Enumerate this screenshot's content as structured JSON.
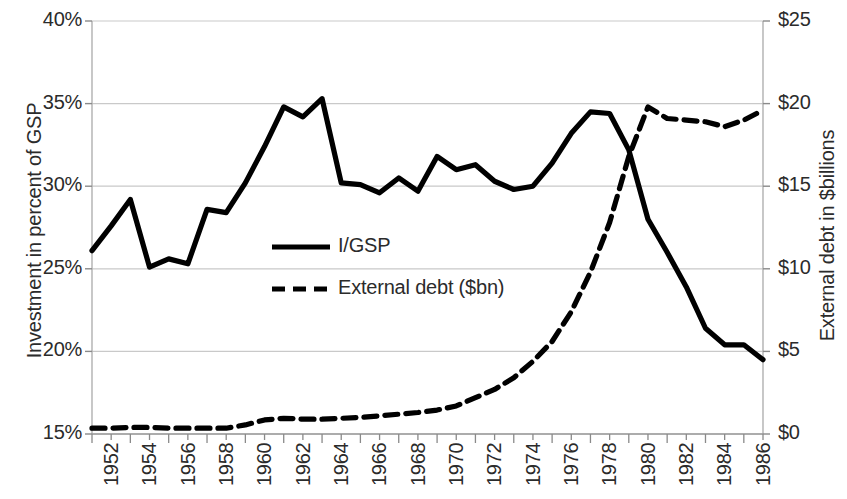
{
  "chart_data": {
    "type": "line",
    "title": "",
    "xlabel": "",
    "ylabel": "Investment in percent of GSP",
    "y2label": "External debt in $billions",
    "grid": true,
    "legend_position": "center-left-inside",
    "ylim": [
      15,
      40
    ],
    "y2lim": [
      0,
      25
    ],
    "ytick_labels": [
      "40%",
      "35%",
      "30%",
      "25%",
      "20%",
      "15%"
    ],
    "ytick_values": [
      40,
      35,
      30,
      25,
      20,
      15
    ],
    "y2tick_labels": [
      "$25",
      "$20",
      "$15",
      "$10",
      "$5",
      "$0"
    ],
    "y2tick_values": [
      25,
      20,
      15,
      10,
      5,
      0
    ],
    "x": [
      1952,
      1953,
      1954,
      1955,
      1956,
      1957,
      1958,
      1959,
      1960,
      1961,
      1962,
      1963,
      1964,
      1965,
      1966,
      1967,
      1968,
      1969,
      1970,
      1971,
      1972,
      1973,
      1974,
      1975,
      1976,
      1977,
      1978,
      1979,
      1980,
      1981,
      1982,
      1983,
      1984,
      1985,
      1986,
      1987
    ],
    "xtick_labels": [
      "1952",
      "1954",
      "1956",
      "1958",
      "1960",
      "1962",
      "1964",
      "1966",
      "1968",
      "1970",
      "1972",
      "1974",
      "1976",
      "1978",
      "1980",
      "1982",
      "1984",
      "1986"
    ],
    "xtick_values": [
      1952,
      1954,
      1956,
      1958,
      1960,
      1962,
      1964,
      1966,
      1968,
      1970,
      1972,
      1974,
      1976,
      1978,
      1980,
      1982,
      1984,
      1986
    ],
    "xlim": [
      1952,
      1987
    ],
    "series": [
      {
        "name": "I/GSP",
        "axis": "left",
        "style": "solid",
        "color": "#000000",
        "unit": "percent",
        "values": [
          26.1,
          27.6,
          29.2,
          25.1,
          25.6,
          25.3,
          28.6,
          28.4,
          30.2,
          32.4,
          34.8,
          34.2,
          35.3,
          30.2,
          30.1,
          29.6,
          30.5,
          29.7,
          31.8,
          31.0,
          31.3,
          30.3,
          29.8,
          30.0,
          31.4,
          33.2,
          34.5,
          34.4,
          32.2,
          28.0,
          26.0,
          23.9,
          21.4,
          20.4,
          20.4,
          19.5
        ]
      },
      {
        "name": "External debt ($bn)",
        "axis": "right",
        "style": "dashed",
        "color": "#000000",
        "unit": "billions_usd",
        "values": [
          0.35,
          0.35,
          0.4,
          0.4,
          0.35,
          0.35,
          0.35,
          0.35,
          0.55,
          0.85,
          0.95,
          0.9,
          0.9,
          0.95,
          1.0,
          1.1,
          1.2,
          1.3,
          1.45,
          1.7,
          2.2,
          2.7,
          3.4,
          4.4,
          5.6,
          7.4,
          9.8,
          12.8,
          16.8,
          19.8,
          19.1,
          19.0,
          18.9,
          18.6,
          19.0,
          19.6
        ]
      }
    ]
  },
  "legend": {
    "items": [
      {
        "label": "I/GSP",
        "style": "solid"
      },
      {
        "label": "External debt ($bn)",
        "style": "dashed"
      }
    ]
  }
}
